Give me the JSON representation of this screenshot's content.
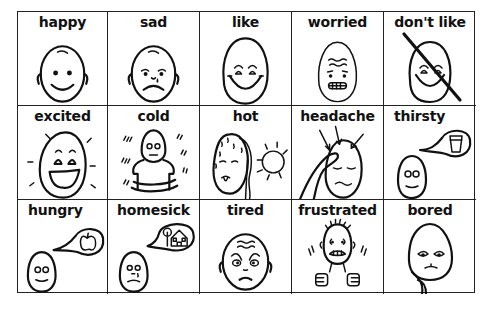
{
  "cells": [
    {
      "label": "happy",
      "icon": "happy-face-icon"
    },
    {
      "label": "sad",
      "icon": "sad-face-icon"
    },
    {
      "label": "like",
      "icon": "like-face-icon"
    },
    {
      "label": "worried",
      "icon": "worried-face-icon"
    },
    {
      "label": "don't like",
      "icon": "dont-like-face-icon"
    },
    {
      "label": "excited",
      "icon": "excited-face-icon"
    },
    {
      "label": "cold",
      "icon": "cold-person-icon"
    },
    {
      "label": "hot",
      "icon": "hot-face-sun-icon"
    },
    {
      "label": "headache",
      "icon": "headache-face-icon"
    },
    {
      "label": "thirsty",
      "icon": "thirsty-face-glass-icon"
    },
    {
      "label": "hungry",
      "icon": "hungry-face-apple-icon"
    },
    {
      "label": "homesick",
      "icon": "homesick-face-house-icon"
    },
    {
      "label": "tired",
      "icon": "tired-face-icon"
    },
    {
      "label": "frustrated",
      "icon": "frustrated-person-icon"
    },
    {
      "label": "bored",
      "icon": "bored-face-icon"
    }
  ],
  "colors": {
    "ink": "#111111",
    "background": "#ffffff",
    "grid": "#222222"
  }
}
